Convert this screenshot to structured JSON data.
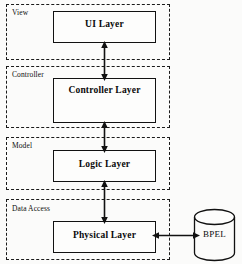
{
  "diagram": {
    "background_color": "#fbfbfa",
    "ink_color": "#111111",
    "tiers": [
      {
        "id": "view",
        "label": "View"
      },
      {
        "id": "controller",
        "label": "Controller"
      },
      {
        "id": "model",
        "label": "Model"
      },
      {
        "id": "data_access",
        "label": "Data Access"
      }
    ],
    "layers": [
      {
        "id": "ui",
        "label": "UI Layer"
      },
      {
        "id": "controller",
        "label": "Controller Layer"
      },
      {
        "id": "logic",
        "label": "Logic Layer"
      },
      {
        "id": "physical",
        "label": "Physical Layer"
      }
    ],
    "datastore": {
      "id": "bpel",
      "label": "BPEL",
      "shape": "cylinder"
    },
    "connectors": [
      {
        "id": "ui-controller",
        "from": "ui",
        "to": "controller",
        "direction": "bidirectional",
        "orientation": "vertical"
      },
      {
        "id": "controller-logic",
        "from": "controller",
        "to": "logic",
        "direction": "bidirectional",
        "orientation": "vertical"
      },
      {
        "id": "logic-physical",
        "from": "logic",
        "to": "physical",
        "direction": "bidirectional",
        "orientation": "vertical"
      },
      {
        "id": "physical-bpel",
        "from": "physical",
        "to": "bpel",
        "direction": "bidirectional",
        "orientation": "horizontal"
      }
    ]
  }
}
